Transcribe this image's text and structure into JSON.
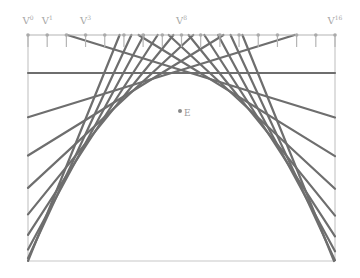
{
  "diagram": {
    "frame": {
      "left": 28,
      "right": 335,
      "top": 35,
      "bottom": 261,
      "color": "#c8c8c8"
    },
    "axis": {
      "y": 35,
      "tick_count": 17,
      "tick_len": 12,
      "color": "#b4b4b4"
    },
    "labels": [
      {
        "base": "V",
        "sup": "0",
        "tick": 0
      },
      {
        "base": "V",
        "sup": "1",
        "tick": 1
      },
      {
        "base": "V",
        "sup": "3",
        "tick": 3
      },
      {
        "base": "V",
        "sup": "8",
        "tick": 8
      },
      {
        "base": "V",
        "sup": "16",
        "tick": 16
      }
    ],
    "envelope": {
      "vertex_x": 181,
      "vertex_y": 73,
      "curvature": 0.00803,
      "tangent_offsets": [
        -153.6,
        -134.4,
        -115.2,
        -96,
        -76.8,
        -57.6,
        -38.4,
        -19.2,
        0,
        19.2,
        38.4,
        57.6,
        76.8,
        96,
        115.2,
        134.4,
        153.6
      ],
      "line_color": "#6e6e6e",
      "line_width": 2.2
    },
    "point": {
      "x": 181,
      "y": 111,
      "label": "E",
      "color": "#888888"
    }
  }
}
